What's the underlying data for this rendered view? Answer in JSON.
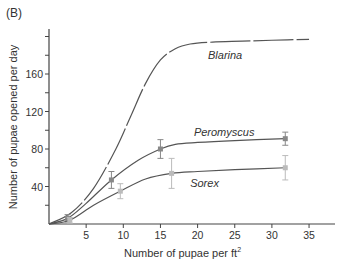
{
  "panel_label": "(B)",
  "chart_data": {
    "type": "line",
    "title": "",
    "xlabel": "Number of pupae per ft",
    "xlabel_sup": "2",
    "ylabel": "Number of pupae opened per day",
    "xlim": [
      0,
      38
    ],
    "ylim": [
      0,
      205
    ],
    "xticks": [
      5,
      10,
      15,
      20,
      25,
      30,
      35
    ],
    "yticks_labeled": [
      40,
      80,
      120,
      160
    ],
    "yticks_minor": [
      20,
      60,
      100,
      140,
      180,
      200
    ],
    "grid": false,
    "legend": "inline labels",
    "series": [
      {
        "name": "Blarina",
        "style": "dashed",
        "color": "#555555",
        "curve": [
          [
            0,
            0
          ],
          [
            3,
            12
          ],
          [
            6,
            38
          ],
          [
            9,
            80
          ],
          [
            11,
            115
          ],
          [
            13,
            150
          ],
          [
            15,
            175
          ],
          [
            17,
            187
          ],
          [
            19,
            192
          ],
          [
            22,
            194
          ],
          [
            26,
            195
          ],
          [
            30,
            196
          ],
          [
            35,
            197
          ]
        ],
        "points": [],
        "label_pos": [
          21.4,
          176
        ]
      },
      {
        "name": "Peromyscus",
        "style": "solid",
        "color": "#555555",
        "marker_color": "#888888",
        "curve": [
          [
            0,
            0
          ],
          [
            2.5,
            6
          ],
          [
            5,
            22
          ],
          [
            8.4,
            47
          ],
          [
            12,
            68
          ],
          [
            15,
            80
          ],
          [
            17,
            85
          ],
          [
            20,
            87
          ],
          [
            25,
            89
          ],
          [
            31.8,
            91
          ]
        ],
        "points": [
          {
            "x": 2.5,
            "y": 6,
            "err": 4
          },
          {
            "x": 8.4,
            "y": 47,
            "err": 9
          },
          {
            "x": 15,
            "y": 80,
            "err": 10
          },
          {
            "x": 31.8,
            "y": 91,
            "err": 7
          }
        ],
        "label_pos": [
          19.5,
          94
        ]
      },
      {
        "name": "Sorex",
        "style": "solid",
        "color": "#555555",
        "marker_color": "#bbbbbb",
        "curve": [
          [
            0,
            0
          ],
          [
            2.8,
            4
          ],
          [
            6,
            20
          ],
          [
            9.6,
            35
          ],
          [
            13,
            48
          ],
          [
            16.5,
            54
          ],
          [
            20,
            56
          ],
          [
            25,
            58
          ],
          [
            31.8,
            60
          ]
        ],
        "points": [
          {
            "x": 2.8,
            "y": 4,
            "err": 3
          },
          {
            "x": 9.6,
            "y": 35,
            "err": 8
          },
          {
            "x": 16.5,
            "y": 54,
            "err": 16
          },
          {
            "x": 31.8,
            "y": 60,
            "err": 13
          }
        ],
        "label_pos": [
          19.0,
          40
        ]
      }
    ]
  }
}
